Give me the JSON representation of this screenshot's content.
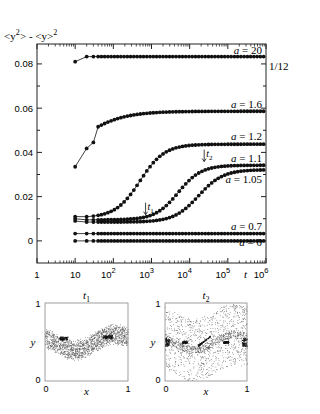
{
  "chart_data": [
    {
      "type": "line",
      "title": "",
      "ylabel": "<y²> - <y>²",
      "xlabel": "t",
      "xscale": "log",
      "xlim": [
        1,
        1000000
      ],
      "ylim": [
        -0.01,
        0.089
      ],
      "x_ticks": [
        {
          "value": 1,
          "base": "1",
          "exp": ""
        },
        {
          "value": 10,
          "base": "10",
          "exp": ""
        },
        {
          "value": 100,
          "base": "10",
          "exp": "2"
        },
        {
          "value": 1000,
          "base": "10",
          "exp": "3"
        },
        {
          "value": 10000,
          "base": "10",
          "exp": "4"
        },
        {
          "value": 100000,
          "base": "10",
          "exp": "5"
        },
        {
          "value": 1000000,
          "base": "10",
          "exp": "6"
        }
      ],
      "y_ticks": [
        {
          "value": 0,
          "label": "0"
        },
        {
          "value": 0.02,
          "label": "0.02"
        },
        {
          "value": 0.04,
          "label": "0.04"
        },
        {
          "value": 0.06,
          "label": "0.06"
        },
        {
          "value": 0.08,
          "label": "0.08"
        }
      ],
      "reference_line": {
        "value": 0.0833,
        "label": "1/12"
      },
      "series": [
        {
          "name": "a = 20",
          "label": "a = 20",
          "t_start": 10,
          "y_start": 0.081,
          "y_early": 0.0833,
          "y_final": 0.0833,
          "t_rise_mid": 10,
          "rise_width": 0.15
        },
        {
          "name": "a = 1.6",
          "label": "a = 1.6",
          "t_start": 10,
          "y_start": 0.0335,
          "y_early": 0.0335,
          "y_final": 0.0586,
          "t_rise_mid": 12,
          "rise_width": 0.55
        },
        {
          "name": "a = 1.2",
          "label": "a = 1.2",
          "t_start": 10,
          "y_start": 0.011,
          "y_early": 0.0105,
          "y_final": 0.0437,
          "t_rise_mid": 500,
          "rise_width": 0.32
        },
        {
          "name": "a = 1.1",
          "label": "a = 1.1",
          "t_start": 10,
          "y_start": 0.01,
          "y_early": 0.0095,
          "y_final": 0.0342,
          "t_rise_mid": 5000,
          "rise_width": 0.3
        },
        {
          "name": "a = 1.05",
          "label": "a = 1.05",
          "t_start": 10,
          "y_start": 0.009,
          "y_early": 0.0085,
          "y_final": 0.0322,
          "t_rise_mid": 17000,
          "rise_width": 0.32
        },
        {
          "name": "a = 0.7",
          "label": "a = 0.7",
          "t_start": 10,
          "y_start": 0.0033,
          "y_early": 0.0033,
          "y_final": 0.0033,
          "t_rise_mid": 10,
          "rise_width": 0.2
        },
        {
          "name": "a = 0",
          "label": "a = 0",
          "t_start": 10,
          "y_start": 0.0,
          "y_early": 0.0,
          "y_final": 0.0,
          "t_rise_mid": 10,
          "rise_width": 0.2
        }
      ],
      "annotations": [
        {
          "label": "t",
          "sub": "1",
          "t": 700,
          "y": 0.0105
        },
        {
          "label": "t",
          "sub": "2",
          "t": 24000,
          "y": 0.0345
        }
      ]
    },
    {
      "type": "scatter",
      "title": "t₁",
      "title_base": "t",
      "title_sub": "1",
      "xlabel": "x",
      "ylabel": "y",
      "xlim": [
        0,
        1
      ],
      "ylim": [
        0,
        1
      ],
      "tick_labels": {
        "x0": "0",
        "x1": "1",
        "y0": "0",
        "y1": "1"
      },
      "description": "points concentrated in a sinusoidal band around y≈0.5"
    },
    {
      "type": "scatter",
      "title": "t₂",
      "title_base": "t",
      "title_sub": "2",
      "xlabel": "x",
      "ylabel": "y",
      "xlim": [
        0,
        1
      ],
      "ylim": [
        0,
        1
      ],
      "tick_labels": {
        "x0": "0",
        "x1": "1",
        "y0": "0",
        "y1": "1"
      },
      "description": "points diffusely spread with dense clusters along y≈0.5"
    }
  ]
}
